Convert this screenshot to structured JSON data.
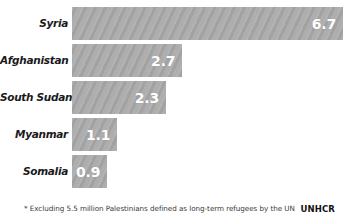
{
  "chart_data": {
    "type": "bar",
    "orientation": "horizontal",
    "title": "",
    "subtitle": "",
    "xlabel": "",
    "ylabel": "",
    "xlim": [
      0,
      6.7
    ],
    "grid": false,
    "legend": null,
    "categories": [
      "Syria",
      "Afghanistan",
      "South Sudan",
      "Myanmar",
      "Somalia"
    ],
    "values": [
      6.7,
      2.7,
      2.3,
      1.1,
      0.9
    ],
    "value_labels": [
      "6.7",
      "2.7",
      "2.3",
      "1.1",
      "0.9"
    ],
    "bars": [
      {
        "category": "Syria",
        "value": 6.7,
        "label": "6.7",
        "width_pct": 100.0
      },
      {
        "category": "Afghanistan",
        "value": 2.7,
        "label": "2.7",
        "width_pct": 40.7
      },
      {
        "category": "South Sudan",
        "value": 2.3,
        "label": "2.3",
        "width_pct": 34.7
      },
      {
        "category": "Myanmar",
        "value": 1.1,
        "label": "1.1",
        "width_pct": 16.7
      },
      {
        "category": "Somalia",
        "value": 0.9,
        "label": "0.9",
        "width_pct": 13.0
      }
    ],
    "annotations": [
      "* Excluding 5.5 million Palestinians defined as long-term refugees by the UN"
    ],
    "colors": {
      "bar": "#a9a9a9",
      "value_text": "#ffffff",
      "label_text": "#1a1a1a",
      "background": "#ffffff",
      "footnote_text": "#3a3a3a"
    }
  },
  "footer": {
    "footnote": "* Excluding 5.5 million Palestinians defined as long-term refugees by the UN",
    "brand": "UNHCR"
  }
}
